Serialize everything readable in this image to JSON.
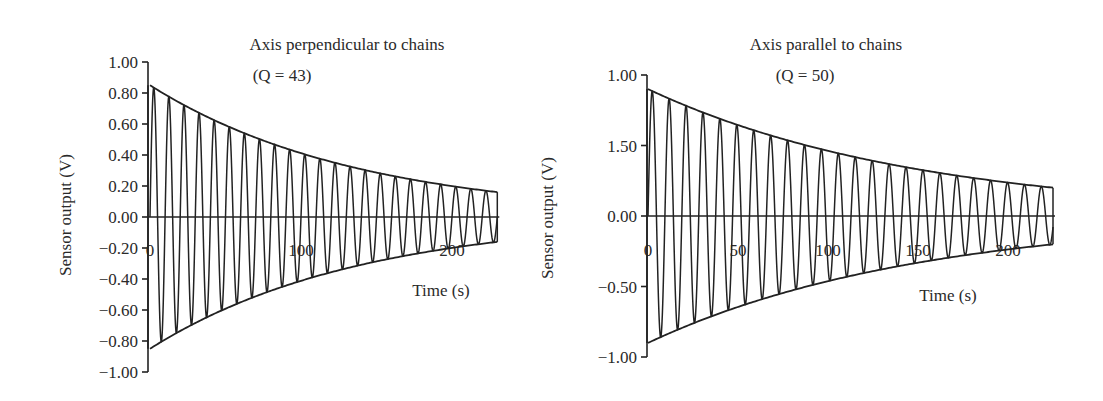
{
  "chart_data": [
    {
      "type": "line",
      "title": "Axis perpendicular to chains",
      "subtitle": "(Q = 43)",
      "xlabel": "Time  (s)",
      "ylabel": "Sensor output  (V)",
      "xlim": [
        0,
        230
      ],
      "ylim": [
        -1.0,
        1.0
      ],
      "x_ticks": [
        0,
        100,
        200
      ],
      "x_tick_labels": [
        "0",
        "100",
        "200"
      ],
      "y_ticks": [
        1.0,
        0.8,
        0.6,
        0.4,
        0.2,
        0.0,
        -0.2,
        -0.4,
        -0.6,
        -0.8,
        -1.0
      ],
      "y_tick_labels": [
        "1.00",
        "0.80",
        "0.60",
        "0.40",
        "0.20",
        "0.00",
        "−0.20",
        "−0.40",
        "−0.60",
        "−0.80",
        "−1.00"
      ],
      "grid": false,
      "legend": null,
      "series": [
        {
          "name": "Damped oscillation",
          "model": "A0*exp(-t/tau)*sin(2*pi*t/T)",
          "A0": 0.85,
          "tau_s": 138,
          "period_s": 10.0,
          "t_end": 230
        },
        {
          "name": "Upper envelope",
          "model": "A0*exp(-t/tau)",
          "start": 0.85,
          "end": 0.16
        },
        {
          "name": "Lower envelope",
          "model": "-A0*exp(-t/tau)",
          "start": -0.85,
          "end": -0.16
        }
      ],
      "annotations": {
        "Q": 43
      }
    },
    {
      "type": "line",
      "title": "Axis parallel to chains",
      "subtitle": "(Q = 50)",
      "xlabel": "Time (s)",
      "ylabel": "Sensor output (V)",
      "xlim": [
        0,
        225
      ],
      "ylim": [
        -1.0,
        1.0
      ],
      "x_ticks": [
        0,
        50,
        100,
        150,
        200
      ],
      "x_tick_labels": [
        "0",
        "50",
        "100",
        "150",
        "200"
      ],
      "y_ticks": [
        1.0,
        0.5,
        0.0,
        -0.5,
        -1.0
      ],
      "y_tick_labels": [
        "1.00",
        "1.50",
        "0.00",
        "−0.50",
        "−1.00"
      ],
      "grid": false,
      "legend": null,
      "series": [
        {
          "name": "Damped oscillation",
          "model": "A0*exp(-t/tau)*sin(2*pi*t/T)",
          "A0": 0.9,
          "tau_s": 150,
          "period_s": 9.4,
          "t_end": 225
        },
        {
          "name": "Upper envelope",
          "model": "A0*exp(-t/tau)",
          "start": 0.9,
          "end": 0.22
        },
        {
          "name": "Lower envelope",
          "model": "-A0*exp(-t/tau)",
          "start": -0.9,
          "end": -0.22
        }
      ],
      "annotations": {
        "Q": 50
      }
    }
  ],
  "layout": [
    {
      "x0_px": 150,
      "px_per_s": 1.51,
      "y0_px": 217,
      "px_per_v": 155,
      "axis_x_px": 148,
      "title_x": 347,
      "title_y": 50,
      "subtitle_x": 282,
      "subtitle_y": 81,
      "xlabel_x": 441,
      "xlabel_y": 296,
      "ylabel_x": 71,
      "ylabel_y": 215,
      "xtick_label_y": 256
    },
    {
      "x0_px": 648,
      "px_per_s": 1.8,
      "y0_px": 216,
      "px_per_v": 141,
      "axis_x_px": 647,
      "title_x": 826,
      "title_y": 50,
      "subtitle_x": 805,
      "subtitle_y": 81,
      "xlabel_x": 948,
      "xlabel_y": 301,
      "ylabel_x": 553,
      "ylabel_y": 218,
      "xtick_label_y": 256
    }
  ]
}
